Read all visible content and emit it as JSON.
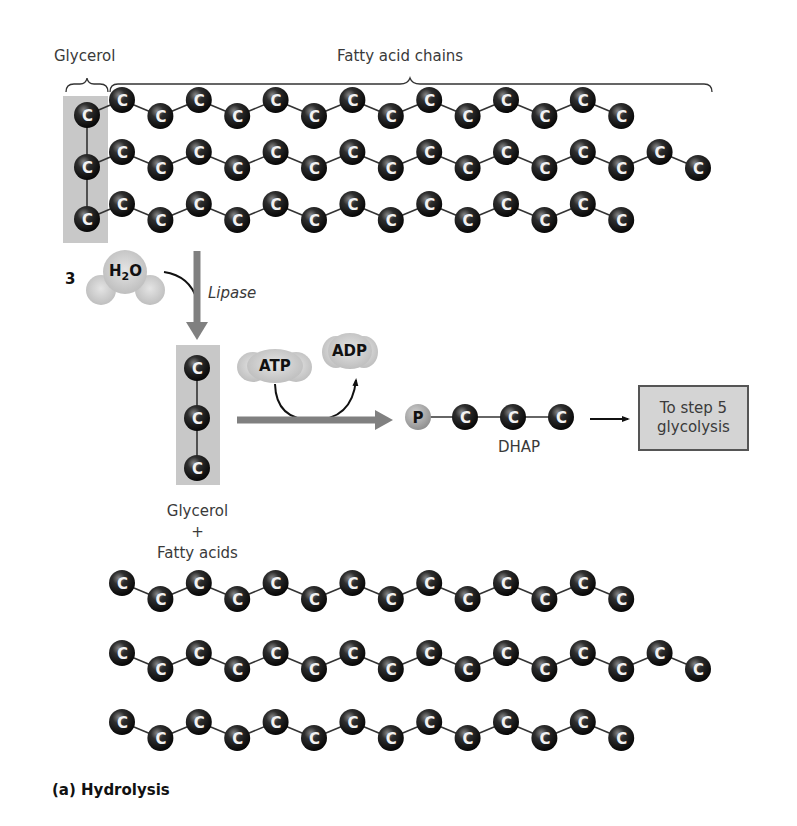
{
  "labels": {
    "glycerol_top": "Glycerol",
    "fatty_acid_chains": "Fatty acid chains",
    "water_count": "3",
    "water_formula_h": "H",
    "water_formula_sub": "2",
    "water_formula_o": "O",
    "enzyme": "Lipase",
    "atp": "ATP",
    "adp": "ADP",
    "phosphate": "P",
    "dhap": "DHAP",
    "step_box_line1": "To step 5",
    "step_box_line2": "glycolysis",
    "products_line1": "Glycerol",
    "products_plus": "+",
    "products_line2": "Fatty acids",
    "caption": "(a) Hydrolysis"
  },
  "atom_symbol": "C",
  "colors": {
    "carbon": "#1a1a1a",
    "glycerol_box": "#c8c8c8",
    "arrow": "#808080",
    "cloud": "#cfcfcf",
    "phosphate": "#a8a8a8",
    "bond": "#333333"
  },
  "triglyceride": {
    "glycerol_carbons": 3,
    "chain_carbon_counts": [
      14,
      16,
      14
    ]
  },
  "released": {
    "glycerol_carbons": 3,
    "fatty_acid_carbon_counts": [
      14,
      16,
      14
    ]
  },
  "dhap": {
    "phosphate_count": 1,
    "carbon_count": 3
  }
}
